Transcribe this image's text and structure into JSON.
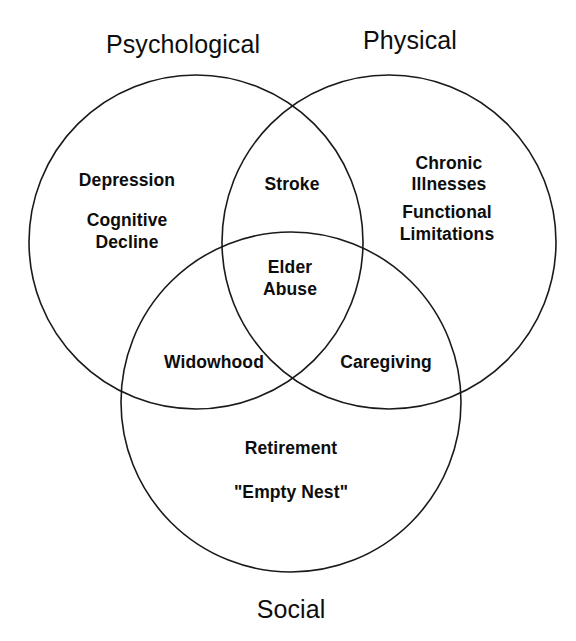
{
  "diagram": {
    "type": "venn",
    "set_count": 3,
    "stroke_color": "#1a1a1a",
    "fill_color": "none",
    "background_color": "#ffffff",
    "text_color": "#0d0d0d",
    "titles": {
      "psychological": "Psychological",
      "physical": "Physical",
      "social": "Social"
    },
    "sets": [
      {
        "id": "psychological",
        "title": "Psychological",
        "title_position": "top-left",
        "cx": 196,
        "cy": 242,
        "r": 167
      },
      {
        "id": "physical",
        "title": "Physical",
        "title_position": "top-right",
        "cx": 389,
        "cy": 242,
        "r": 167
      },
      {
        "id": "social",
        "title": "Social",
        "title_position": "bottom",
        "cx": 291,
        "cy": 402,
        "r": 170
      }
    ],
    "regions": [
      {
        "id": "psychological-only",
        "sets": [
          "psychological"
        ],
        "items": [
          "Depression",
          "Cognitive\nDecline"
        ]
      },
      {
        "id": "physical-only",
        "sets": [
          "physical"
        ],
        "items": [
          "Chronic Illnesses",
          "Functional\nLimitations"
        ]
      },
      {
        "id": "social-only",
        "sets": [
          "social"
        ],
        "items": [
          "Retirement",
          "\"Empty Nest\""
        ]
      },
      {
        "id": "psychological-physical",
        "sets": [
          "psychological",
          "physical"
        ],
        "items": [
          "Stroke"
        ]
      },
      {
        "id": "psychological-social",
        "sets": [
          "psychological",
          "social"
        ],
        "items": [
          "Widowhood"
        ]
      },
      {
        "id": "physical-social",
        "sets": [
          "physical",
          "social"
        ],
        "items": [
          "Caregiving"
        ]
      },
      {
        "id": "all-three",
        "sets": [
          "psychological",
          "physical",
          "social"
        ],
        "items": [
          "Elder\nAbuse"
        ]
      }
    ],
    "labels": {
      "depression": "Depression",
      "cognitive_decline": "Cognitive\nDecline",
      "chronic_illnesses": "Chronic Illnesses",
      "functional_limitations": "Functional\nLimitations",
      "stroke": "Stroke",
      "elder_abuse": "Elder\nAbuse",
      "widowhood": "Widowhood",
      "caregiving": "Caregiving",
      "retirement": "Retirement",
      "empty_nest": "\"Empty Nest\""
    }
  }
}
